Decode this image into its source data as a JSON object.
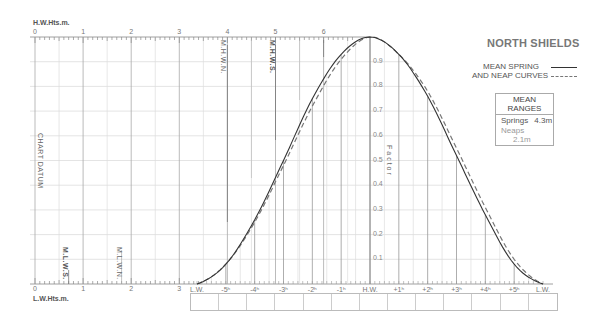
{
  "title": "NORTH SHIELDS",
  "legend": {
    "line1": "MEAN SPRING",
    "line2": "AND NEAP CURVES",
    "spring_style": "solid",
    "neap_style": "dashed"
  },
  "mean_ranges": {
    "header": "MEAN RANGES",
    "springs_label": "Springs",
    "springs_value": "4.3m",
    "neaps_label": "Neaps",
    "neaps_value": "2.1m"
  },
  "axes": {
    "top_label": "H.W.Hts.m.",
    "bottom_label": "L.W.Hts.m.",
    "height_ticks": [
      "0",
      "1",
      "2",
      "3",
      "4",
      "5",
      "6"
    ],
    "bottom_height_ticks": [
      "0",
      "1",
      "2",
      "3"
    ],
    "factor_label": "Factor",
    "factor_ticks": [
      "0.1",
      "0.2",
      "0.3",
      "0.4",
      "0.5",
      "0.6",
      "0.7",
      "0.8",
      "0.9"
    ],
    "time_ticks": [
      "L.W.",
      "-5ʰ",
      "-4ʰ",
      "-3ʰ",
      "-2ʰ",
      "-1ʰ",
      "H.W.",
      "+1ʰ",
      "+2ʰ",
      "+3ʰ",
      "+4ʰ",
      "+5ʰ",
      "L.W."
    ],
    "chart_datum_label": "CHART DATUM"
  },
  "levels": {
    "mhws": "M.H.W.S.",
    "mhwn": "M.H.W.N.",
    "mlws": "M.L.W.S.",
    "mlwn": "M.L.W.N."
  },
  "time_boxes_count": 13,
  "chart_data": {
    "type": "line",
    "title": "NORTH SHIELDS",
    "xlabel": "Hours relative to High Water",
    "ylabel": "Factor",
    "x": [
      -6,
      -5,
      -4,
      -3,
      -2,
      -1,
      0,
      1,
      2,
      3,
      4,
      5,
      6
    ],
    "series": [
      {
        "name": "Mean Spring",
        "style": "solid",
        "values": [
          0.0,
          0.08,
          0.26,
          0.5,
          0.75,
          0.93,
          1.0,
          0.93,
          0.76,
          0.52,
          0.28,
          0.08,
          0.0
        ]
      },
      {
        "name": "Mean Neap",
        "style": "dashed",
        "values": [
          0.0,
          0.08,
          0.25,
          0.48,
          0.72,
          0.91,
          1.0,
          0.93,
          0.78,
          0.55,
          0.31,
          0.1,
          0.0
        ]
      }
    ],
    "ylim": [
      0,
      1.0
    ],
    "height_scale_m": [
      0,
      6
    ],
    "mean_ranges": {
      "springs_m": 4.3,
      "neaps_m": 2.1
    }
  }
}
